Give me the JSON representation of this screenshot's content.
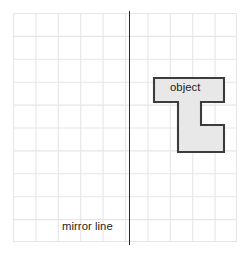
{
  "figure": {
    "kind": "reflection-worksheet",
    "background_color": "#ffffff"
  },
  "grid": {
    "columns": 10,
    "rows": 10,
    "cell_size_px": 22.4,
    "line_color": "#e3e3e3",
    "border_color": "#dcdcdc",
    "origin_x_px": 13,
    "origin_y_px": 13,
    "width_px": 224,
    "height_px": 229
  },
  "mirror_line": {
    "label": "mirror line",
    "color": "#2b2b2b",
    "orientation": "vertical",
    "x_px": 129,
    "grid_column_index": 5
  },
  "object": {
    "label": "object",
    "fill_color": "#e8e8e8",
    "stroke_color": "#3c3c3c",
    "stroke_width_px": 2,
    "shape": "T-rotated-polygon",
    "cells_wide": 3,
    "cells_tall": 3,
    "polygon_points": "4,4 74,4 74,28 51,28 51,51 74,51 74,78 28,78 28,28 4,28"
  }
}
